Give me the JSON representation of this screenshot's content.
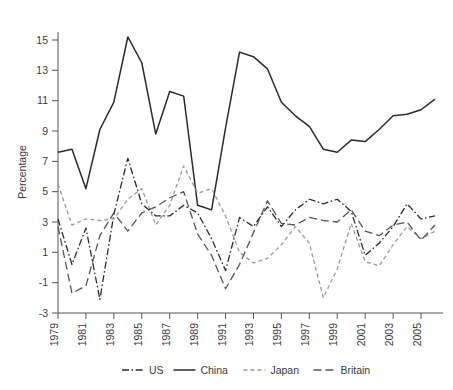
{
  "chart_data": {
    "type": "line",
    "title": "",
    "xlabel": "",
    "ylabel": "Percentage",
    "xlim": [
      1979,
      2006
    ],
    "ylim": [
      -3,
      16
    ],
    "grid": false,
    "legend_position": "bottom",
    "x": [
      1979,
      1980,
      1981,
      1982,
      1983,
      1984,
      1985,
      1986,
      1987,
      1988,
      1989,
      1990,
      1991,
      1992,
      1993,
      1994,
      1995,
      1996,
      1997,
      1998,
      1999,
      2000,
      2001,
      2002,
      2003,
      2004,
      2005,
      2006
    ],
    "xticks": [
      "1979",
      "1981",
      "1983",
      "1985",
      "1987",
      "1989",
      "1991",
      "1993",
      "1995",
      "1997",
      "1999",
      "2001",
      "2003",
      "2005"
    ],
    "yticks": [
      "15",
      "13",
      "11",
      "9",
      "7",
      "5",
      "3",
      "1",
      "-1",
      "-3"
    ],
    "series": [
      {
        "name": "US",
        "style": "dash-dot",
        "color": "#2b2b2b",
        "values": [
          3.2,
          0.2,
          2.6,
          -2.1,
          3.5,
          7.2,
          4.2,
          3.4,
          3.4,
          4.1,
          3.6,
          1.9,
          -0.2,
          3.3,
          2.7,
          4.0,
          2.7,
          3.8,
          4.5,
          4.2,
          4.5,
          3.7,
          0.8,
          1.6,
          2.7,
          4.2,
          3.2,
          3.4
        ]
      },
      {
        "name": "China",
        "style": "solid",
        "color": "#2b2b2b",
        "values": [
          7.6,
          7.8,
          5.2,
          9.1,
          10.9,
          15.2,
          13.5,
          8.8,
          11.6,
          11.3,
          4.1,
          3.8,
          9.2,
          14.2,
          13.9,
          13.1,
          10.9,
          10.0,
          9.3,
          7.8,
          7.6,
          8.4,
          8.3,
          9.1,
          10.0,
          10.1,
          10.4,
          11.1
        ]
      },
      {
        "name": "Japan",
        "style": "dashed-light",
        "color": "#9a9a9a",
        "values": [
          5.5,
          2.8,
          3.2,
          3.1,
          3.2,
          4.5,
          5.2,
          2.8,
          4.1,
          6.7,
          4.9,
          5.2,
          3.4,
          1.0,
          0.3,
          0.6,
          1.5,
          2.7,
          1.6,
          -2.0,
          -0.1,
          2.9,
          0.4,
          0.1,
          1.5,
          2.7,
          1.9,
          2.4
        ]
      },
      {
        "name": "Britain",
        "style": "dashed-long",
        "color": "#555555",
        "values": [
          2.7,
          -1.7,
          -1.2,
          2.1,
          3.6,
          2.4,
          3.6,
          4.0,
          4.6,
          5.0,
          2.2,
          0.8,
          -1.4,
          0.2,
          2.3,
          4.4,
          2.9,
          2.8,
          3.3,
          3.1,
          3.0,
          3.8,
          2.4,
          2.1,
          2.8,
          3.0,
          1.8,
          2.8
        ]
      }
    ]
  },
  "axis": {
    "ylabel": "Percentage",
    "ytick_labels": [
      "15",
      "13",
      "11",
      "9",
      "7",
      "5",
      "3",
      "1",
      "-1",
      "-3"
    ],
    "xtick_labels": [
      "1979",
      "1981",
      "1983",
      "1985",
      "1987",
      "1989",
      "1991",
      "1993",
      "1995",
      "1997",
      "1999",
      "2001",
      "2003",
      "2005"
    ]
  },
  "legend": {
    "items": [
      {
        "label": "US",
        "style": "dash-dot"
      },
      {
        "label": "China",
        "style": "solid"
      },
      {
        "label": "Japan",
        "style": "dashed-light"
      },
      {
        "label": "Britain",
        "style": "dashed-long"
      }
    ]
  }
}
